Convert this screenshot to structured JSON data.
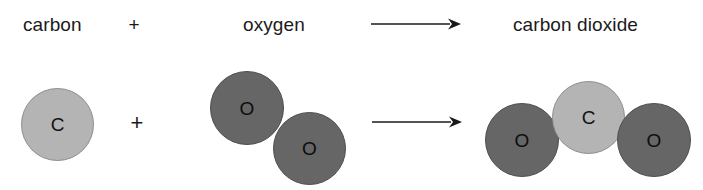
{
  "diagram": {
    "type": "chemical-equation",
    "colors": {
      "carbon_fill": "#b4b4b4",
      "carbon_stroke": "#8d8d8d",
      "oxygen_fill": "#666666",
      "oxygen_stroke": "#4e4e4e",
      "text": "#1a1a1a",
      "background": "#ffffff"
    },
    "word_equation": {
      "reactant_1_label": "carbon",
      "plus_label": "+",
      "reactant_2_label": "oxygen",
      "arrow_label": "→",
      "product_label": "carbon dioxide"
    },
    "model_equation": {
      "plus_label": "+",
      "arrow_label": "→",
      "reactant_1": {
        "name": "carbon",
        "atoms": [
          {
            "symbol": "C",
            "element": "carbon"
          }
        ]
      },
      "reactant_2": {
        "name": "oxygen",
        "atoms": [
          {
            "symbol": "O",
            "element": "oxygen"
          },
          {
            "symbol": "O",
            "element": "oxygen"
          }
        ]
      },
      "product": {
        "name": "carbon dioxide",
        "atoms": [
          {
            "symbol": "O",
            "element": "oxygen"
          },
          {
            "symbol": "C",
            "element": "carbon"
          },
          {
            "symbol": "O",
            "element": "oxygen"
          }
        ]
      }
    }
  }
}
